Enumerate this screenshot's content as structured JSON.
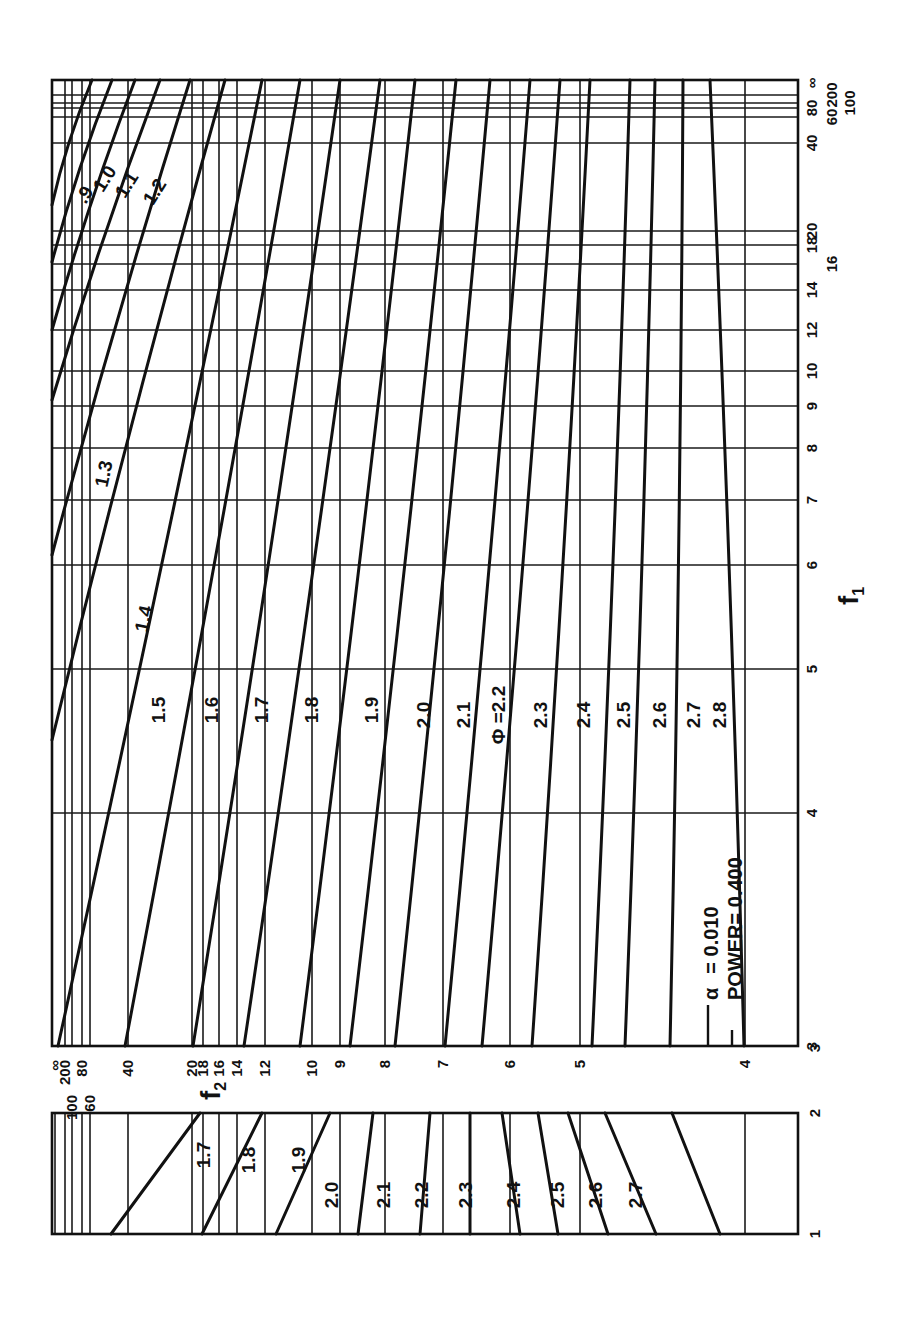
{
  "chart_data": {
    "type": "line",
    "title": "",
    "orientation": "rotated 90° clockwise (page printed sideways)",
    "annotations": {
      "alpha_label": "α",
      "alpha_text": "= 0.010",
      "power_text": "POWER= 0.400",
      "phi_prefix": "Φ ="
    },
    "xlabel": "f1",
    "ylabel": "f2",
    "f1_axis": {
      "scale": "reciprocal",
      "ticks": [
        "3",
        "4",
        "5",
        "6",
        "7",
        "8",
        "9",
        "10",
        "12",
        "14",
        "16",
        "18",
        "20",
        "40",
        "60",
        "80",
        "100",
        "200",
        "∞"
      ]
    },
    "f2_axis": {
      "scale": "reciprocal",
      "ticks": [
        "∞",
        "200",
        "100",
        "80",
        "60",
        "40",
        "20",
        "18",
        "16",
        "14",
        "12",
        "10",
        "9",
        "8",
        "7",
        "6",
        "5",
        "4"
      ],
      "right_tick": "3"
    },
    "inset": {
      "f1_range": [
        "1",
        "2"
      ],
      "series_labels": [
        "1.7",
        "1.8",
        "1.9",
        "2.0",
        "2.1",
        "2.2",
        "2.3",
        "2.4",
        "2.5",
        "2.6",
        "2.7"
      ]
    },
    "series_labels": [
      ".9",
      "1.0",
      "1.1",
      "1.2",
      "1.3",
      "1.4",
      "1.5",
      "1.6",
      "1.7",
      "1.8",
      "1.9",
      "2.0",
      "2.1",
      "2.2",
      "2.3",
      "2.4",
      "2.5",
      "2.6",
      "2.7",
      "2.8"
    ],
    "series": [
      {
        "name": "Φ=0.9",
        "note": "contour of f2 vs f1, steepest curve upper-left"
      },
      {
        "name": "Φ=1.0"
      },
      {
        "name": "Φ=1.1"
      },
      {
        "name": "Φ=1.2"
      },
      {
        "name": "Φ=1.3"
      },
      {
        "name": "Φ=1.4"
      },
      {
        "name": "Φ=1.5"
      },
      {
        "name": "Φ=1.6"
      },
      {
        "name": "Φ=1.7"
      },
      {
        "name": "Φ=1.8"
      },
      {
        "name": "Φ=1.9"
      },
      {
        "name": "Φ=2.0"
      },
      {
        "name": "Φ=2.1"
      },
      {
        "name": "Φ=2.2"
      },
      {
        "name": "Φ=2.3"
      },
      {
        "name": "Φ=2.4"
      },
      {
        "name": "Φ=2.5"
      },
      {
        "name": "Φ=2.6"
      },
      {
        "name": "Φ=2.7"
      },
      {
        "name": "Φ=2.8"
      }
    ],
    "grid": true,
    "legend": "none (curves labeled inline)"
  },
  "labels": {
    "f1_title": "f",
    "f1_sub": "1",
    "f2_title": "f",
    "f2_sub": "2"
  }
}
